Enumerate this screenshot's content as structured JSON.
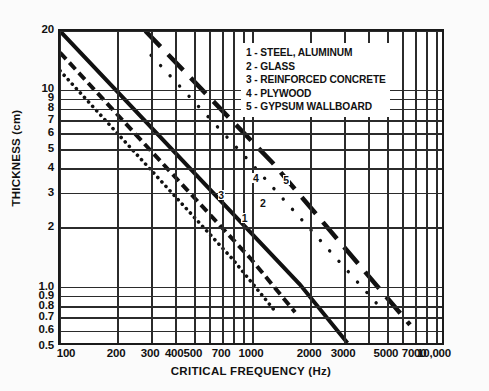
{
  "chart_data": {
    "type": "line",
    "title": "",
    "xlabel": "CRITICAL FREQUENCY (Hz)",
    "ylabel": "THICKNESS (cm)",
    "xscale": "log",
    "yscale": "log",
    "xlim": [
      100,
      10000
    ],
    "ylim": [
      0.5,
      20
    ],
    "grid": true,
    "legend_position": "upper-right-inside",
    "xticks": [
      100,
      200,
      300,
      400,
      500,
      700,
      1000,
      2000,
      3000,
      5000,
      7000,
      10000
    ],
    "xticklabels": [
      "100",
      "200",
      "300",
      "400",
      "500",
      "700",
      "1000",
      "2000",
      "3000",
      "5000",
      "7000",
      "10,000"
    ],
    "yticks": [
      0.5,
      0.6,
      0.7,
      0.8,
      0.9,
      1.0,
      2,
      3,
      4,
      5,
      6,
      7,
      8,
      9,
      10,
      20
    ],
    "yticklabels": [
      "0.5",
      "0.6",
      "0.7",
      "0.8",
      "0.9",
      "1.0",
      "2",
      "3",
      "4",
      "5",
      "6",
      "7",
      "8",
      "9",
      "10",
      "20"
    ],
    "vgridlines": [
      100,
      200,
      300,
      400,
      500,
      600,
      700,
      800,
      900,
      1000,
      2000,
      3000,
      4000,
      5000,
      6000,
      7000,
      8000,
      9000,
      10000
    ],
    "hgridlines": [
      0.5,
      0.6,
      0.7,
      0.8,
      0.9,
      1.0,
      2,
      3,
      4,
      5,
      6,
      7,
      8,
      9,
      10,
      20
    ],
    "series": [
      {
        "id": 1,
        "name": "STEEL, ALUMINUM",
        "style": "solid",
        "label_x": 900,
        "label_y": 2.25,
        "points": [
          [
            100,
            20
          ],
          [
            1800,
            1.0
          ],
          [
            3200,
            0.5
          ]
        ]
      },
      {
        "id": 2,
        "name": "GLASS",
        "style": "dashed",
        "label_x": 1120,
        "label_y": 2.7,
        "points": [
          [
            100,
            15.5
          ],
          [
            1000,
            1.35
          ],
          [
            1700,
            0.72
          ]
        ]
      },
      {
        "id": 3,
        "name": "REINFORCED CONCRETE",
        "style": "dotted",
        "label_x": 680,
        "label_y": 2.95,
        "points": [
          [
            100,
            12.5
          ],
          [
            800,
            1.35
          ],
          [
            1350,
            0.72
          ]
        ]
      },
      {
        "id": 4,
        "name": "PLYWOOD",
        "style": "sparse-dotted",
        "label_x": 1030,
        "label_y": 3.6,
        "points": [
          [
            300,
            15.0
          ],
          [
            1000,
            4.2
          ],
          [
            5000,
            0.72
          ]
        ]
      },
      {
        "id": 5,
        "name": "GYPSUM WALLBOARD",
        "style": "long-dash",
        "label_x": 1480,
        "label_y": 3.5,
        "points": [
          [
            280,
            20
          ],
          [
            1300,
            4.2
          ],
          [
            6800,
            0.62
          ]
        ]
      }
    ]
  },
  "legend": {
    "entries": [
      "1 - STEEL, ALUMINUM",
      "2 - GLASS",
      "3 - REINFORCED CONCRETE",
      "4 - PLYWOOD",
      "5 - GYPSUM WALLBOARD"
    ]
  },
  "colors": {
    "line": "#111111",
    "grid": "#2b2b2b",
    "frame": "#1a1a1a",
    "plot_background": "#ffffff",
    "page_background": "#fbfbfb"
  }
}
